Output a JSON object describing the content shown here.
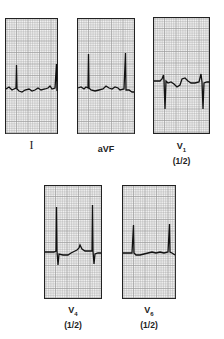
{
  "figure": {
    "type": "ECG lead strips",
    "leads": [
      {
        "id": "I",
        "label": "I",
        "subscript": "",
        "scale": ""
      },
      {
        "id": "aVF",
        "label": "aVF",
        "subscript": "",
        "scale": ""
      },
      {
        "id": "V1",
        "label": "V",
        "subscript": "1",
        "scale": "(1/2)"
      },
      {
        "id": "V4",
        "label": "V",
        "subscript": "4",
        "scale": "(1/2)"
      },
      {
        "id": "V6",
        "label": "V",
        "subscript": "6",
        "scale": "(1/2)"
      }
    ]
  },
  "colors": {
    "grid": "#9a9a9a",
    "trace": "#111111",
    "border": "#222222",
    "paper": "#f2f2f2"
  }
}
